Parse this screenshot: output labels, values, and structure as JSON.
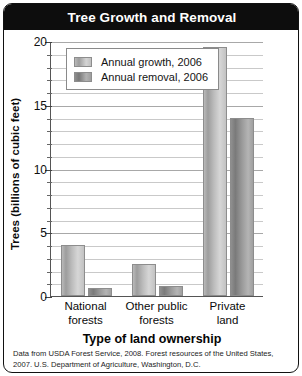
{
  "chart_data": {
    "type": "bar",
    "title": "Tree Growth and Removal",
    "xlabel": "Type of land ownership",
    "ylabel": "Trees (billions of cubic feet)",
    "categories": [
      "National forests",
      "Other public forests",
      "Private land"
    ],
    "category_lines": [
      [
        "National",
        "forests"
      ],
      [
        "Other public",
        "forests"
      ],
      [
        "Private",
        "land"
      ]
    ],
    "series": [
      {
        "name": "Annual growth, 2006",
        "values": [
          4.0,
          2.5,
          19.5
        ]
      },
      {
        "name": "Annual removal, 2006",
        "values": [
          0.6,
          0.8,
          14.0
        ]
      }
    ],
    "ylim": [
      0,
      20
    ],
    "ytick_labels": [
      "0",
      "5",
      "10",
      "15",
      "20"
    ],
    "ytick_values": [
      0,
      5,
      10,
      15,
      20
    ],
    "minor_tick_step": 1,
    "grid": true,
    "legend_position": "upper-left-inside",
    "source_note": "Data from USDA Forest Service, 2008. Forest resources of the United States, 2007. U.S. Department of Agriculture, Washington, D.C."
  },
  "colors": {
    "title_bar": "#0d0d0d",
    "title_text": "#ffffff",
    "growth_bar": "#bcbcbc",
    "removal_bar": "#9a9a9a",
    "gridline": "#c9c9c9",
    "axis": "#555555"
  }
}
